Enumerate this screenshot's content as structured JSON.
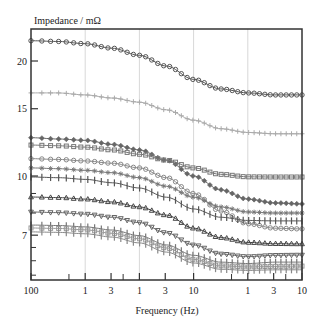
{
  "chart_data": {
    "type": "line",
    "title": "",
    "ylabel": "Impedance / mΩ",
    "xlabel": "Frequency (Hz)",
    "yscale": "log",
    "xscale": "log",
    "ylim": [
      5.3,
      24.5
    ],
    "y_ticks": [
      {
        "value": 20,
        "label": "20"
      },
      {
        "value": 15,
        "label": "15"
      },
      {
        "value": 10,
        "label": "10"
      },
      {
        "value": 7,
        "label": "7"
      }
    ],
    "y_minor_ticks": [
      9,
      8,
      6.5,
      6,
      5.5
    ],
    "x_tick_labels": [
      "100",
      "1",
      "3",
      "1",
      "3",
      "10",
      "1",
      "3",
      "10"
    ],
    "x_tick_positions": [
      0,
      1,
      1.477,
      2,
      2.477,
      3,
      4,
      4.477,
      5
    ],
    "x_minor_positions": [
      0.7,
      1.7,
      3.7,
      4.7
    ],
    "x_grid_positions": [
      1,
      2,
      3,
      4
    ],
    "grid": "vertical",
    "legend": "none",
    "x": [
      0,
      0.5,
      1,
      1.5,
      2,
      2.5,
      3,
      3.5,
      4,
      4.5,
      5
    ],
    "series": [
      {
        "name": "series-1",
        "marker": "circle",
        "color": "#555555",
        "values": [
          22.6,
          22.5,
          22.2,
          21.6,
          20.7,
          19.4,
          17.9,
          16.9,
          16.5,
          16.3,
          16.3
        ]
      },
      {
        "name": "series-2",
        "marker": "plus",
        "color": "#aaaaaa",
        "values": [
          16.5,
          16.5,
          16.3,
          16.0,
          15.6,
          14.9,
          14.0,
          13.3,
          13.0,
          12.9,
          12.9
        ]
      },
      {
        "name": "series-3",
        "marker": "diamond",
        "color": "#666666",
        "values": [
          12.6,
          12.5,
          12.4,
          12.1,
          11.7,
          11.0,
          10.0,
          9.2,
          8.7,
          8.5,
          8.45
        ]
      },
      {
        "name": "series-4",
        "marker": "square",
        "color": "#777777",
        "values": [
          12.05,
          12.0,
          11.9,
          11.7,
          11.4,
          11.0,
          10.5,
          10.1,
          9.95,
          9.94,
          9.94
        ]
      },
      {
        "name": "series-5",
        "marker": "circle",
        "color": "#888888",
        "values": [
          11.1,
          11.05,
          10.95,
          10.8,
          10.5,
          9.9,
          9.0,
          8.1,
          7.5,
          7.3,
          7.27
        ]
      },
      {
        "name": "series-6",
        "marker": "star",
        "color": "#777777",
        "values": [
          10.5,
          10.45,
          10.35,
          10.2,
          9.9,
          9.4,
          8.8,
          8.3,
          8.05,
          8.0,
          8.0
        ]
      },
      {
        "name": "series-7",
        "marker": "bar",
        "color": "#555555",
        "values": [
          9.94,
          9.9,
          9.8,
          9.6,
          9.3,
          8.8,
          8.2,
          7.8,
          7.65,
          7.63,
          7.63
        ]
      },
      {
        "name": "series-8",
        "marker": "triangle",
        "color": "#444444",
        "values": [
          8.81,
          8.78,
          8.7,
          8.55,
          8.3,
          7.9,
          7.3,
          6.9,
          6.7,
          6.65,
          6.64
        ]
      },
      {
        "name": "series-9",
        "marker": "triangle-down",
        "color": "#666666",
        "values": [
          8.05,
          8.02,
          7.95,
          7.8,
          7.55,
          7.1,
          6.6,
          6.25,
          6.15,
          6.2,
          6.21
        ]
      },
      {
        "name": "series-10",
        "marker": "bar",
        "color": "#777777",
        "values": [
          7.44,
          7.42,
          7.36,
          7.22,
          6.98,
          6.6,
          6.2,
          5.95,
          5.9,
          5.95,
          5.95
        ]
      },
      {
        "name": "series-11",
        "marker": "square",
        "color": "#999999",
        "values": [
          7.31,
          7.29,
          7.23,
          7.08,
          6.85,
          6.48,
          6.05,
          5.82,
          5.78,
          5.8,
          5.81
        ]
      },
      {
        "name": "series-12",
        "marker": "bar",
        "color": "#888888",
        "values": [
          7.14,
          7.12,
          7.06,
          6.92,
          6.68,
          6.32,
          5.92,
          5.7,
          5.66,
          5.68,
          5.68
        ]
      }
    ]
  }
}
